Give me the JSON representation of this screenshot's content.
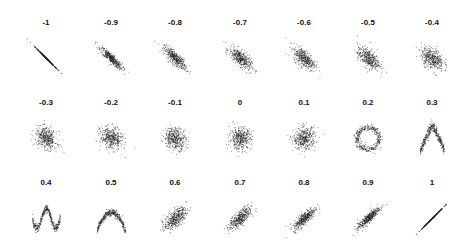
{
  "chart_data": {
    "type": "scatter",
    "title": "",
    "layout": {
      "rows": 3,
      "cols": 7,
      "grid": false,
      "axes_visible": false,
      "legend": "none"
    },
    "point_color": "#222222",
    "points_per_panel": 400,
    "panels": [
      {
        "label": "-1",
        "correlation": -1.0,
        "shape": "linear"
      },
      {
        "label": "-0.9",
        "correlation": -0.9,
        "shape": "linear"
      },
      {
        "label": "-0.8",
        "correlation": -0.8,
        "shape": "linear"
      },
      {
        "label": "-0.7",
        "correlation": -0.7,
        "shape": "linear"
      },
      {
        "label": "-0.6",
        "correlation": -0.6,
        "shape": "linear"
      },
      {
        "label": "-0.5",
        "correlation": -0.5,
        "shape": "linear"
      },
      {
        "label": "-0.4",
        "correlation": -0.4,
        "shape": "linear"
      },
      {
        "label": "-0.3",
        "correlation": -0.3,
        "shape": "linear"
      },
      {
        "label": "-0.2",
        "correlation": -0.2,
        "shape": "linear"
      },
      {
        "label": "-0.1",
        "correlation": -0.1,
        "shape": "linear"
      },
      {
        "label": "0",
        "correlation": 0.0,
        "shape": "linear"
      },
      {
        "label": "0.1",
        "correlation": 0.1,
        "shape": "linear"
      },
      {
        "label": "0.2",
        "correlation": 0.2,
        "shape": "ring"
      },
      {
        "label": "0.3",
        "correlation": 0.3,
        "shape": "inverted-v"
      },
      {
        "label": "0.4",
        "correlation": 0.4,
        "shape": "w-wave"
      },
      {
        "label": "0.5",
        "correlation": 0.5,
        "shape": "parabola"
      },
      {
        "label": "0.6",
        "correlation": 0.6,
        "shape": "linear"
      },
      {
        "label": "0.7",
        "correlation": 0.7,
        "shape": "linear"
      },
      {
        "label": "0.8",
        "correlation": 0.8,
        "shape": "linear"
      },
      {
        "label": "0.9",
        "correlation": 0.9,
        "shape": "linear"
      },
      {
        "label": "1",
        "correlation": 1.0,
        "shape": "linear"
      }
    ]
  }
}
